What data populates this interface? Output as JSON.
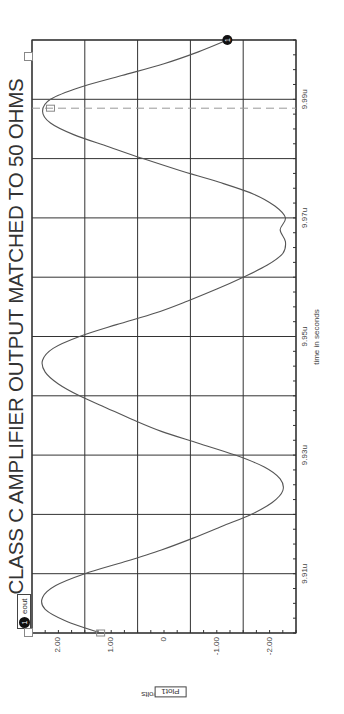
{
  "chart_data": {
    "type": "line",
    "title": "CLASS C AMPLIFIER OUTPUT MATCHED TO 50 OHMS",
    "xlabel": "time in seconds",
    "ylabel": "eout in volts",
    "plot_label": "Plot1",
    "legend": [
      {
        "marker": "1",
        "name": "eout"
      }
    ],
    "xlim": [
      9.9,
      10.0
    ],
    "ylim": [
      -2.5,
      2.5
    ],
    "x_unit": "u",
    "x_ticks": [
      {
        "value": 9.91,
        "label": "9.91u"
      },
      {
        "value": 9.93,
        "label": "9.93u"
      },
      {
        "value": 9.95,
        "label": "9.95u"
      },
      {
        "value": 9.97,
        "label": "9.97u"
      },
      {
        "value": 9.99,
        "label": "9.99u"
      }
    ],
    "y_ticks": [
      {
        "value": 2.0,
        "label": "2.00"
      },
      {
        "value": 1.0,
        "label": "1.00"
      },
      {
        "value": 0,
        "label": "0"
      },
      {
        "value": -1.0,
        "label": "-1.00"
      },
      {
        "value": -2.0,
        "label": "-2.00"
      }
    ],
    "grid": true,
    "orientation": "rotated 90 degrees (time axis vertical on right, voltage axis horizontal at bottom)",
    "cursor": {
      "x": 9.9885,
      "style": "dashed"
    },
    "series": [
      {
        "name": "eout",
        "x": [
          9.9,
          9.902,
          9.904,
          9.906,
          9.908,
          9.91,
          9.912,
          9.914,
          9.916,
          9.918,
          9.92,
          9.922,
          9.924,
          9.926,
          9.928,
          9.93,
          9.932,
          9.934,
          9.936,
          9.938,
          9.94,
          9.942,
          9.944,
          9.946,
          9.948,
          9.95,
          9.952,
          9.954,
          9.956,
          9.958,
          9.96,
          9.962,
          9.964,
          9.966,
          9.968,
          9.97,
          9.972,
          9.974,
          9.976,
          9.978,
          9.98,
          9.982,
          9.984,
          9.986,
          9.988,
          9.99,
          9.992,
          9.994,
          9.996,
          9.998,
          10.0
        ],
        "values": [
          1.2,
          1.85,
          2.25,
          2.3,
          2.05,
          1.5,
          0.75,
          0.05,
          -0.55,
          -1.1,
          -1.65,
          -2.05,
          -2.25,
          -2.2,
          -1.9,
          -1.35,
          -0.65,
          0.05,
          0.6,
          1.1,
          1.6,
          2.0,
          2.25,
          2.3,
          2.1,
          1.6,
          0.9,
          0.15,
          -0.45,
          -1.0,
          -1.5,
          -1.95,
          -2.25,
          -2.3,
          -2.2,
          -2.3,
          -2.1,
          -1.7,
          -1.05,
          -0.3,
          0.4,
          1.05,
          1.7,
          2.15,
          2.3,
          2.15,
          1.6,
          0.8,
          0.0,
          -0.65,
          -1.2
        ]
      }
    ]
  },
  "ui": {
    "legend_marker": "1",
    "legend_label": "eout",
    "end_marker": "1",
    "cursor_box_label": "",
    "plot_box_label": "Plot1",
    "colors": {
      "curve": "#555555",
      "grid": "#333333",
      "cursor": "#999999",
      "text": "#333333"
    }
  }
}
